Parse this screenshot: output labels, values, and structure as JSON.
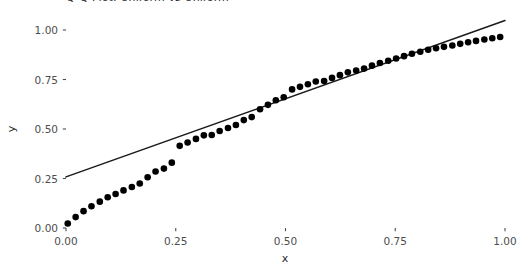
{
  "chart_data": {
    "type": "scatter",
    "title": "Q-Q Plot: Uniform vs Uniform",
    "xlabel": "x",
    "ylabel": "y",
    "xlim": [
      0.0,
      1.0
    ],
    "ylim": [
      0.0,
      1.0
    ],
    "grid": false,
    "legend": "none",
    "background": "#ffffff",
    "point_color": "#000000",
    "line_color": "#1a1a1a",
    "xticks": [
      "0.00",
      "0.25",
      "0.50",
      "0.75",
      "1.00"
    ],
    "xtick_values": [
      0.0,
      0.25,
      0.5,
      0.75,
      1.0
    ],
    "yticks": [
      "0.00",
      "0.25",
      "0.50",
      "0.75",
      "1.00"
    ],
    "ytick_values": [
      0.0,
      0.25,
      0.5,
      0.75,
      1.0
    ],
    "series": [
      {
        "name": "quantile-points",
        "marker": "filled-circle",
        "marker_size": 4.6,
        "x": [
          0.004,
          0.022,
          0.04,
          0.058,
          0.077,
          0.095,
          0.113,
          0.131,
          0.15,
          0.168,
          0.186,
          0.204,
          0.223,
          0.241,
          0.259,
          0.277,
          0.296,
          0.314,
          0.332,
          0.35,
          0.369,
          0.387,
          0.405,
          0.423,
          0.442,
          0.46,
          0.478,
          0.496,
          0.515,
          0.533,
          0.551,
          0.569,
          0.588,
          0.606,
          0.624,
          0.642,
          0.661,
          0.679,
          0.697,
          0.715,
          0.734,
          0.752,
          0.77,
          0.788,
          0.807,
          0.825,
          0.843,
          0.861,
          0.88,
          0.898,
          0.916,
          0.934,
          0.953,
          0.971,
          0.989
        ],
        "y": [
          0.023,
          0.055,
          0.085,
          0.11,
          0.133,
          0.155,
          0.172,
          0.19,
          0.207,
          0.225,
          0.256,
          0.285,
          0.3,
          0.33,
          0.415,
          0.432,
          0.45,
          0.468,
          0.47,
          0.49,
          0.505,
          0.52,
          0.545,
          0.56,
          0.6,
          0.622,
          0.645,
          0.66,
          0.7,
          0.713,
          0.726,
          0.74,
          0.742,
          0.758,
          0.772,
          0.786,
          0.795,
          0.805,
          0.82,
          0.833,
          0.845,
          0.856,
          0.868,
          0.88,
          0.89,
          0.9,
          0.908,
          0.915,
          0.922,
          0.93,
          0.938,
          0.945,
          0.952,
          0.958,
          0.965
        ]
      }
    ],
    "reference_line": {
      "name": "qq-reference-line",
      "x": [
        0.0,
        1.0
      ],
      "y": [
        0.258,
        1.048
      ],
      "slope": 0.79,
      "intercept": 0.258
    }
  }
}
